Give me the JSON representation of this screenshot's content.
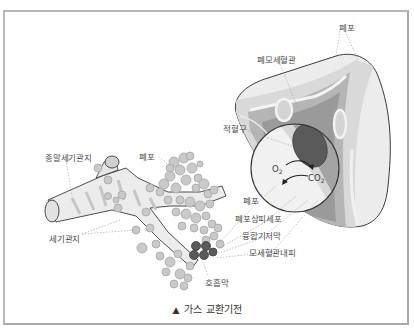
{
  "caption": {
    "marker": "▲",
    "text": "가스 교환기전"
  },
  "labels": {
    "alveolus_top": "폐포",
    "pulmonary_capillary": "폐모세혈관",
    "red_blood_cell": "적혈구",
    "terminal_bronchiole": "종말세기관지",
    "alveolus_cluster": "폐포",
    "bronchiole": "세기관지",
    "respiratory_membrane": "호흡막",
    "alveolus_bottom": "폐포",
    "alveolar_epithelium": "폐포상피세포",
    "fused_basement_membrane": "융합기저막",
    "capillary_endothelium": "모세혈관내피"
  },
  "gases": {
    "o2": "O2",
    "co2": "CO2"
  },
  "colors": {
    "frame": "#b8b8b8",
    "alveolus_fill": "#c9c9c9",
    "alveolus_stroke": "#a6a6a6",
    "capillary_dark": "#8f8f8f",
    "capillary_mid": "#b5b5b5",
    "light_band": "#e2e2e2",
    "rbc": "#5a5a5a",
    "text": "#4a4a4a"
  }
}
